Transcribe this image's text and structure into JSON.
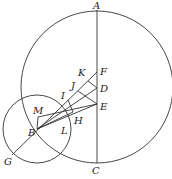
{
  "diagram": {
    "labels": {
      "A": "A",
      "B": "B",
      "C": "C",
      "D": "D",
      "E": "E",
      "F": "F",
      "G": "G",
      "H": "H",
      "I": "I",
      "J": "J",
      "K": "K",
      "L": "L",
      "M": "M"
    },
    "points": {
      "A": [
        97,
        10
      ],
      "C": [
        97,
        163
      ],
      "F": [
        97,
        72
      ],
      "D": [
        97,
        88
      ],
      "E": [
        97,
        104
      ],
      "B": [
        37,
        129
      ],
      "G": [
        12,
        155
      ],
      "I": [
        68,
        100
      ],
      "J": [
        78,
        91
      ],
      "K": [
        88,
        81
      ],
      "H": [
        75,
        119
      ],
      "L": [
        67,
        125
      ],
      "M": [
        38,
        116
      ]
    },
    "circles": {
      "large": {
        "cx": 97,
        "cy": 87,
        "r": 76
      },
      "small": {
        "cx": 37,
        "cy": 129,
        "r": 34
      }
    },
    "stroke_color": "#333333"
  }
}
